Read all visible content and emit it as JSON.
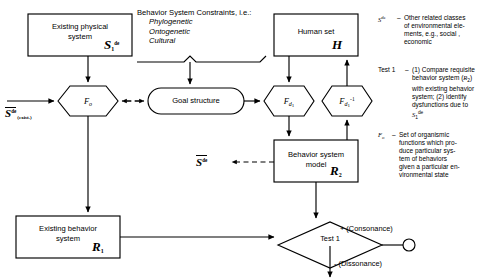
{
  "diagram": {
    "nodes": {
      "existing_physical_system": {
        "label_line1": "Existing physical",
        "label_line2": "system",
        "symbol_base": "S",
        "symbol_sub": "1",
        "symbol_sup": "de"
      },
      "human_set": {
        "label": "Human set",
        "symbol_base": "H"
      },
      "goal_structure": {
        "label": "Goal structure"
      },
      "f_o_hexagon": {
        "symbol_base": "F",
        "symbol_sub": "o"
      },
      "f_d1_hexagon": {
        "symbol_base": "F",
        "symbol_sub": "d",
        "symbol_sub2": "1"
      },
      "f_d1_inv_hexagon": {
        "symbol_base": "F",
        "symbol_sub": "d",
        "symbol_sub2": "1",
        "symbol_sup": "-1"
      },
      "behavior_system_model": {
        "label_line1": "Behavior system",
        "label_line2": "model",
        "symbol_base": "R",
        "symbol_sub": "2"
      },
      "existing_behavior_system": {
        "label_line1": "Existing behavior",
        "label_line2": "system",
        "symbol_base": "R",
        "symbol_sub": "1"
      },
      "test1_diamond": {
        "label": "Test 1"
      }
    },
    "input_label": {
      "symbol_base": "S",
      "symbol_sup": "de",
      "symbol_sub": "(exist.)",
      "has_overbar": true
    },
    "output_label": {
      "symbol_base": "S",
      "symbol_sup": "de",
      "has_overbar": true
    },
    "constraints": {
      "heading": "Behavior System Constraints, i.e.:",
      "items": [
        "Phylogenetic",
        "Ontogenetic",
        "Cultural"
      ]
    },
    "branches": {
      "consonance": "+ (Consonance)",
      "dissonance": "- (Dissonance)"
    },
    "legend": [
      {
        "key_base": "S",
        "key_sup": "de",
        "key_sub": "",
        "dash": "–",
        "text": "Other related classes of environmental elements, e.g., social , economic"
      },
      {
        "key_base": "Test 1",
        "key_sup": "",
        "key_sub": "",
        "dash": "–",
        "text": "(1) Compare requisite behavior system (R2) with existing behavior system; (2) identify dysfunctions due to S1de"
      },
      {
        "key_base": "F",
        "key_sup": "",
        "key_sub": "o",
        "dash": "–",
        "text": "Set of organismic functions which produce particular system of behaviors given a particular environmental state"
      }
    ],
    "legend_detail": {
      "entry1_lines": [
        "Other related classes",
        "of environmental ele-",
        "ments, e.g., social ,",
        "economic"
      ],
      "entry2_lines": [
        "(1) Compare requisite",
        "behavior system (R2)",
        "with existing behavior",
        "system;  (2) identify",
        "dysfunctions due to",
        "S1de"
      ],
      "entry3_lines": [
        "Set of organismic",
        "functions which pro-",
        "duce particular sys-",
        "tem of behaviors",
        "given a particular en-",
        "vironmental state"
      ]
    },
    "colors": {
      "stroke": "#000000",
      "background": "#ffffff"
    }
  }
}
